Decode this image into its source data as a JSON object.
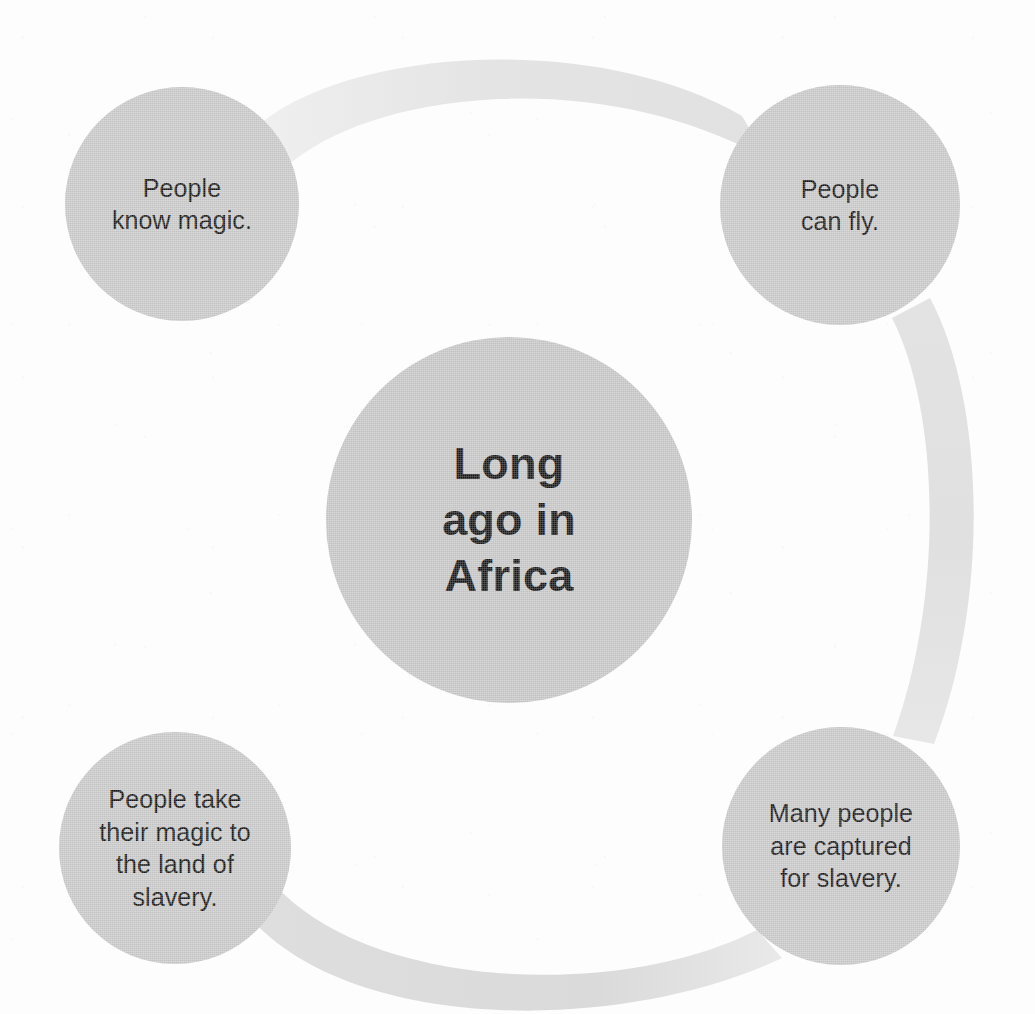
{
  "diagram": {
    "type": "cycle-circle-map",
    "title_node": {
      "id": "center",
      "text": "Long\nago in\nAfrica",
      "cx": 509,
      "cy": 520,
      "r": 183
    },
    "nodes": [
      {
        "id": "node-know-magic",
        "name": "people-know-magic",
        "text": "People\nknow magic.",
        "cx": 182,
        "cy": 204,
        "r": 117,
        "order": 1
      },
      {
        "id": "node-can-fly",
        "name": "people-can-fly",
        "text": "People\ncan fly.",
        "cx": 840,
        "cy": 205,
        "r": 120,
        "order": 2
      },
      {
        "id": "node-captured",
        "name": "many-people-captured",
        "text": "Many people\nare captured\nfor slavery.",
        "cx": 841,
        "cy": 846,
        "r": 119,
        "order": 3
      },
      {
        "id": "node-take-magic",
        "name": "people-take-magic",
        "text": "People take\ntheir magic to\nthe land of\nslavery.",
        "cx": 175,
        "cy": 848,
        "r": 116,
        "order": 4
      }
    ],
    "connectors": [
      {
        "id": "arc-top",
        "from": "node-know-magic",
        "to": "node-can-fly",
        "shade": "#e6e6e6"
      },
      {
        "id": "arc-right",
        "from": "node-can-fly",
        "to": "node-captured",
        "shade": "#e2e2e2"
      },
      {
        "id": "arc-bottom",
        "from": "node-captured",
        "to": "node-take-magic",
        "shade": "#dcdcdc"
      }
    ],
    "colors": {
      "background": "#fdfdfd",
      "node_fill": "#c9c9c9",
      "center_fill": "#c7c7c7",
      "text": "#151515",
      "arc_light": "#e6e6e6",
      "arc_mid": "#e2e2e2",
      "arc_dark": "#dcdcdc"
    }
  }
}
